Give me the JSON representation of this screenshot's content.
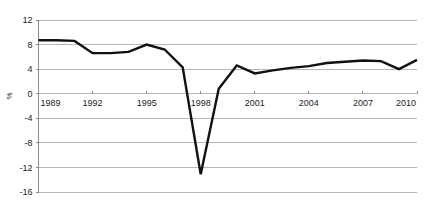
{
  "chart_data": {
    "type": "line",
    "title": "",
    "xlabel": "",
    "ylabel": "%",
    "xlim": [
      1989,
      2010
    ],
    "ylim": [
      -16,
      12
    ],
    "ytick_labels": [
      "12",
      "8",
      "4",
      "0",
      "-4",
      "-8",
      "-12",
      "-16"
    ],
    "yticks": [
      12,
      8,
      4,
      0,
      -4,
      -8,
      -12,
      -16
    ],
    "xtick_labels": [
      "1989",
      "1992",
      "1995",
      "1998",
      "2001",
      "2004",
      "2007",
      "2010"
    ],
    "xticks": [
      1989,
      1992,
      1995,
      1998,
      2001,
      2004,
      2007,
      2010
    ],
    "grid": "horizontal-gridlines-at-yticks",
    "legend": "none",
    "line_color": "#111111",
    "grid_color": "#9a9a9a",
    "axis_color": "#7d7d7d",
    "text_color": "#1a1a1a",
    "series": [
      {
        "name": "growth",
        "x": [
          1989,
          1990,
          1991,
          1992,
          1993,
          1994,
          1995,
          1996,
          1997,
          1998,
          1999,
          2000,
          2001,
          2002,
          2003,
          2004,
          2005,
          2006,
          2007,
          2008,
          2009,
          2010
        ],
        "values": [
          8.7,
          8.7,
          8.6,
          6.6,
          6.6,
          6.8,
          8.0,
          7.2,
          4.3,
          -13.1,
          0.8,
          4.6,
          3.3,
          3.8,
          4.2,
          4.5,
          5.0,
          5.2,
          5.4,
          5.3,
          4.0,
          5.5
        ]
      }
    ]
  }
}
